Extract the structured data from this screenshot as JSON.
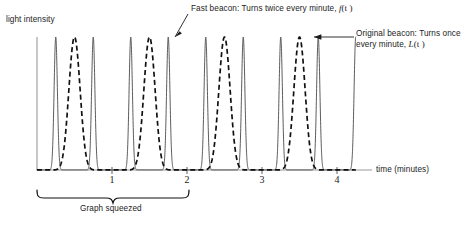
{
  "figure": {
    "y_axis_label": "light intensity",
    "x_axis_label": "time (minutes)",
    "brace_label": "Graph squeezed",
    "annotations": {
      "fast_line1": "Fast beacon: Turns twice every minute, ",
      "fast_math_var": "f",
      "fast_math_arg": "(t )",
      "original_line1": "Original beacon: Turns once",
      "original_line2": "every minute, ",
      "original_math_var": "L",
      "original_math_arg": "(t )"
    },
    "tick_labels": [
      "1",
      "2",
      "3",
      "4"
    ],
    "colors": {
      "axis": "#8c8c8c",
      "solid_curve": "#4a4a4a",
      "dashed_curve": "#111111",
      "text": "#1c1c1c",
      "brace": "#111111",
      "background": "#ffffff"
    }
  },
  "chart_data": {
    "type": "line",
    "title": "",
    "xlabel": "time (minutes)",
    "ylabel": "light intensity",
    "xlim": [
      0,
      4.3
    ],
    "ylim": [
      0,
      1.08
    ],
    "xticks": [
      1,
      2,
      3,
      4
    ],
    "xtick_labels": [
      "1",
      "2",
      "3",
      "4"
    ],
    "yticks": [],
    "grid": false,
    "legend": "annotations",
    "axis_origin_time": 0,
    "series": [
      {
        "name": "f(t)",
        "label": "Fast beacon: Turns twice every minute, f(t)",
        "style": "solid",
        "color": "#4a4a4a",
        "period_minutes": 0.5,
        "turns_per_minute": 2,
        "peak_times": [
          0.25,
          0.75,
          1.25,
          1.75,
          2.25,
          2.75,
          3.25,
          3.75
        ],
        "peak_value": 1.0,
        "baseline_value": 0.0,
        "peak_sharpness": 26
      },
      {
        "name": "L(t)",
        "label": "Original beacon: Turns once every minute, L(t)",
        "style": "dashed",
        "color": "#111111",
        "period_minutes": 1.0,
        "turns_per_minute": 1,
        "peak_times": [
          0.5,
          1.5,
          2.5,
          3.5
        ],
        "peak_value": 1.0,
        "baseline_value": 0.0,
        "peak_sharpness": 9
      }
    ],
    "annotations": [
      {
        "text": "Fast beacon: Turns twice every minute, f(t)",
        "points_to_time": 1.75,
        "points_to_value": 1.0
      },
      {
        "text": "Original beacon: Turns once every minute, L(t)",
        "points_to_time": 3.5,
        "points_to_value": 1.0
      },
      {
        "text": "Graph squeezed",
        "brace_from_time": 0.0,
        "brace_to_time": 2.0
      }
    ]
  }
}
